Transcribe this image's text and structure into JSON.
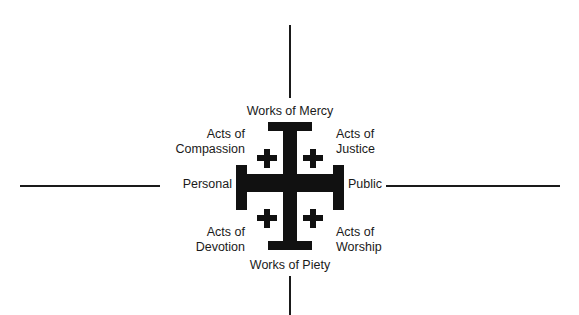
{
  "diagram": {
    "axes": {
      "left": "Personal",
      "right": "Public",
      "top": "Works of Mercy",
      "bottom": "Works of Piety"
    },
    "quadrants": {
      "top_left": {
        "line1": "Acts of",
        "line2": "Compassion"
      },
      "top_right": {
        "line1": "Acts of",
        "line2": "Justice"
      },
      "bottom_left": {
        "line1": "Acts of",
        "line2": "Devotion"
      },
      "bottom_right": {
        "line1": "Acts of",
        "line2": "Worship"
      }
    },
    "center_symbol": "jerusalem-cross",
    "colors": {
      "ink": "#1a1a1a",
      "background": "#ffffff"
    }
  }
}
